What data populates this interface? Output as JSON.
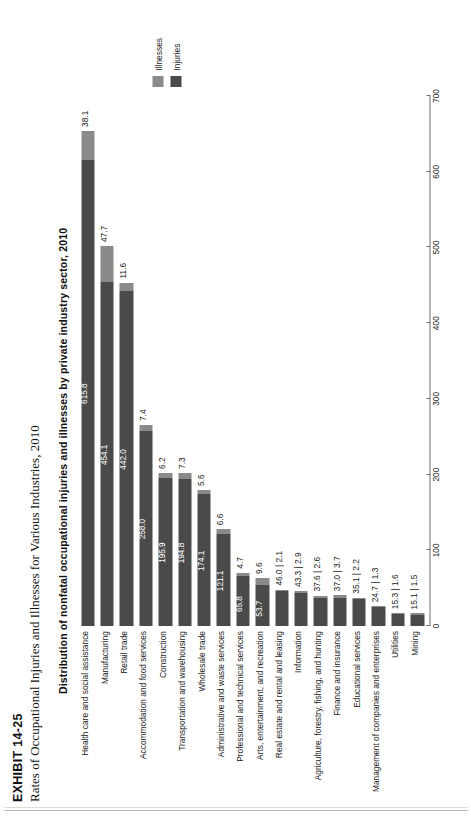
{
  "exhibit": {
    "number": "EXHIBIT 14-25",
    "subtitle": "Rates of Occupational Injuries and Illnesses for Various Industries, 2010"
  },
  "legend": {
    "items": [
      {
        "label": "Illnesses",
        "color": "#8a8a8a"
      },
      {
        "label": "Injuries",
        "color": "#4a4a4a"
      }
    ]
  },
  "chart_data": {
    "type": "bar",
    "orientation": "horizontal",
    "stacked": true,
    "title": "Distribution of nonfatal occupational injuries and illnesses by private industry sector, 2010",
    "xlabel": "",
    "ylabel": "",
    "xlim": [
      0,
      700
    ],
    "xticks": [
      0,
      100,
      200,
      300,
      400,
      500,
      600,
      700
    ],
    "grid": false,
    "legend_position": "right",
    "categories": [
      "Health care and social assistance",
      "Manufacturing",
      "Retail trade",
      "Accommodation and food services",
      "Construction",
      "Transportation and warehousing",
      "Wholesale trade",
      "Administrative and waste services",
      "Professional and technical services",
      "Arts, entertainment, and recreation",
      "Real estate and rental and leasing",
      "Information",
      "Agriculture, forestry, fishing, and hunting",
      "Finance and insurance",
      "Educational services",
      "Management of companies and enterprises",
      "Utilities",
      "Mining"
    ],
    "series": [
      {
        "name": "Injuries",
        "color": "#4a4a4a",
        "values": [
          615.8,
          454.1,
          442.0,
          258.0,
          195.9,
          194.8,
          174.1,
          121.1,
          65.8,
          53.7,
          46.0,
          43.3,
          37.6,
          37.0,
          35.1,
          24.7,
          15.3,
          15.1
        ]
      },
      {
        "name": "Illnesses",
        "color": "#8a8a8a",
        "values": [
          38.1,
          47.7,
          11.6,
          7.4,
          6.2,
          7.3,
          5.6,
          6.6,
          4.7,
          9.6,
          2.1,
          2.9,
          2.6,
          3.7,
          2.2,
          1.3,
          1.6,
          1.5
        ]
      }
    ],
    "bar_labels": [
      {
        "injuries": "615.8",
        "illnesses": "38.1",
        "combined": null
      },
      {
        "injuries": "454.1",
        "illnesses": "47.7",
        "combined": null
      },
      {
        "injuries": "442.0",
        "illnesses": "11.6",
        "combined": null
      },
      {
        "injuries": "258.0",
        "illnesses": "7.4",
        "combined": null
      },
      {
        "injuries": "195.9",
        "illnesses": "6.2",
        "combined": null
      },
      {
        "injuries": "194.8",
        "illnesses": "7.3",
        "combined": null
      },
      {
        "injuries": "174.1",
        "illnesses": "5.6",
        "combined": null
      },
      {
        "injuries": "121.1",
        "illnesses": "6.6",
        "combined": null
      },
      {
        "injuries": "65.8",
        "illnesses": "4.7",
        "combined": null
      },
      {
        "injuries": "53.7",
        "illnesses": "9.6",
        "combined": null
      },
      {
        "injuries": null,
        "illnesses": null,
        "combined": "46.0 | 2.1"
      },
      {
        "injuries": null,
        "illnesses": null,
        "combined": "43.3 | 2.9"
      },
      {
        "injuries": null,
        "illnesses": null,
        "combined": "37.6 | 2.6"
      },
      {
        "injuries": null,
        "illnesses": null,
        "combined": "37.0 | 3.7"
      },
      {
        "injuries": null,
        "illnesses": null,
        "combined": "35.1 | 2.2"
      },
      {
        "injuries": null,
        "illnesses": null,
        "combined": "24.7 | 1.3"
      },
      {
        "injuries": null,
        "illnesses": null,
        "combined": "15.3 | 1.6"
      },
      {
        "injuries": null,
        "illnesses": null,
        "combined": "15.1 | 1.5"
      }
    ]
  }
}
